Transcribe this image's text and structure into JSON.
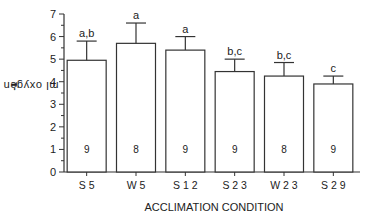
{
  "chart_data": {
    "type": "bar",
    "title": "",
    "xlabel": "ACCLIMATION CONDITION",
    "ylabel": "ml oxygen (g•h)",
    "ylabel_superscript": "-1",
    "ylim": [
      0,
      7
    ],
    "yticks": [
      0,
      1,
      2,
      3,
      4,
      5,
      6,
      7
    ],
    "grid": false,
    "categories": [
      "S 5",
      "W 5",
      "S 1 2",
      "S 2 3",
      "W 2 3",
      "S 2 9"
    ],
    "values": [
      4.95,
      5.7,
      5.4,
      4.45,
      4.25,
      3.9
    ],
    "error_upper": [
      5.8,
      6.6,
      6.0,
      5.0,
      4.85,
      4.25
    ],
    "significance_labels": [
      "a,b",
      "a",
      "a",
      "b,c",
      "b,c",
      "c"
    ],
    "sample_sizes": [
      "9",
      "8",
      "9",
      "9",
      "8",
      "9"
    ]
  },
  "colors": {
    "axis": "#333333",
    "bar_fill": "#ffffff",
    "bar_stroke": "#333333"
  }
}
